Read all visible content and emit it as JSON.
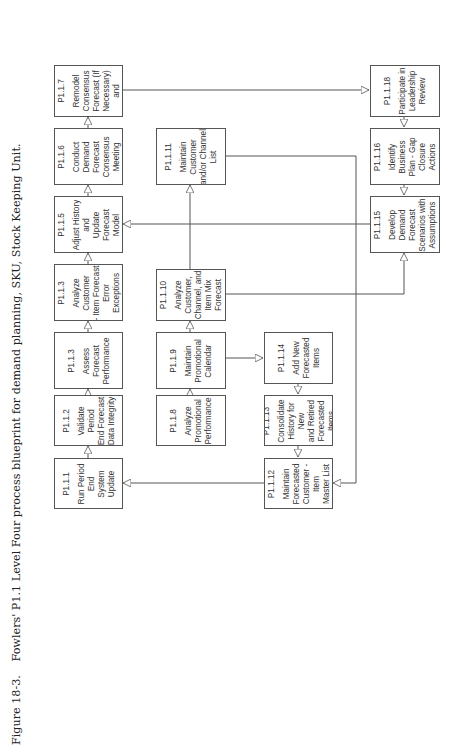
{
  "caption": {
    "number": "Figure 18-3.",
    "text": "Fowlers' P1.1 Level Four process blueprint for demand planning, SKU, Stock Keeping Unit."
  },
  "colors": {
    "line": "#555555",
    "text": "#333333",
    "background": "#ffffff"
  },
  "boxes": {
    "p117": {
      "id": "P1.1.7",
      "label": "Remodel\nConsensus\nForecast (If\nNecessary) and"
    },
    "p116": {
      "id": "P1.1.6",
      "label": "Conduct Demand\nForecast\nConsensus\nMeeting"
    },
    "p115": {
      "id": "P1.1.5",
      "label": "Adjust History and\nUpdate Forecast\nModel"
    },
    "p113a": {
      "id": "P1.1.3",
      "label": "Analyze Customer\n- Item Forecast\nError Exceptions"
    },
    "p113b": {
      "id": "P1.1.3",
      "label": "Assess Forecast\nPerformance"
    },
    "p112": {
      "id": "P1.1.2",
      "label": "Validate Period\nEnd Forecast\nData Integrity"
    },
    "p111": {
      "id": "P1.1.1",
      "label": "Run Period End\nSystem Update"
    },
    "p1111": {
      "id": "P1.1.11",
      "label": "Maintain Customer\nand/or Channel\nList"
    },
    "p1110": {
      "id": "P1.1.10",
      "label": "Analyze\nCustomer,\nChannel, and\nItem Mix Forecast"
    },
    "p119": {
      "id": "P1.1.9",
      "label": "Maintain\nPromotional\nCalendar"
    },
    "p118": {
      "id": "P1.1.8",
      "label": "Analyze\nPromotional\nPerformance"
    },
    "p1114": {
      "id": "P1.1.14",
      "label": "Add New\nForecasted Items"
    },
    "p1113": {
      "id": "P1.1.13",
      "label": "Consolidate\nHistory for New\nand Retired\nForecasted Items"
    },
    "p1112": {
      "id": "P1.1.12",
      "label": "Maintain\nForecasted\nCustomer - Item\nMaster List"
    },
    "p1118": {
      "id": "P1.1.18",
      "label": "Participate in\nLeadership\nReview"
    },
    "p1116": {
      "id": "P1.1.16",
      "label": "Identify Business\nPlan - Gap\nClosure Actions"
    },
    "p1115": {
      "id": "P1.1.15",
      "label": "Develop Demand\nForecast\nScenarios with\nAssumptions"
    }
  },
  "edges": [
    {
      "from": "P1.1.1",
      "to": "P1.1.2"
    },
    {
      "from": "P1.1.2",
      "to": "P1.1.3 (Assess Forecast Performance)"
    },
    {
      "from": "P1.1.3 (Assess Forecast Performance)",
      "to": "P1.1.3 (Analyze Customer - Item Forecast Error Exceptions)"
    },
    {
      "from": "P1.1.3 (Analyze Customer - Item Forecast Error Exceptions)",
      "to": "P1.1.5"
    },
    {
      "from": "P1.1.5",
      "to": "P1.1.6"
    },
    {
      "from": "P1.1.6",
      "to": "P1.1.7"
    },
    {
      "from": "P1.1.7",
      "to": "P1.1.18"
    },
    {
      "from": "P1.1.18",
      "to": "P1.1.16"
    },
    {
      "from": "P1.1.16",
      "to": "P1.1.15"
    },
    {
      "from": "P1.1.15",
      "to": "P1.1.5"
    },
    {
      "from": "P1.1.8",
      "to": "P1.1.9"
    },
    {
      "from": "P1.1.9",
      "to": "P1.1.10"
    },
    {
      "from": "P1.1.9",
      "to": "P1.1.14"
    },
    {
      "from": "P1.1.10",
      "to": "P1.1.11"
    },
    {
      "from": "P1.1.10",
      "to": "P1.1.15"
    },
    {
      "from": "P1.1.11",
      "to": "P1.1.12"
    },
    {
      "from": "P1.1.14",
      "to": "P1.1.13"
    },
    {
      "from": "P1.1.13",
      "to": "P1.1.12"
    },
    {
      "from": "P1.1.12",
      "to": "P1.1.1"
    }
  ]
}
